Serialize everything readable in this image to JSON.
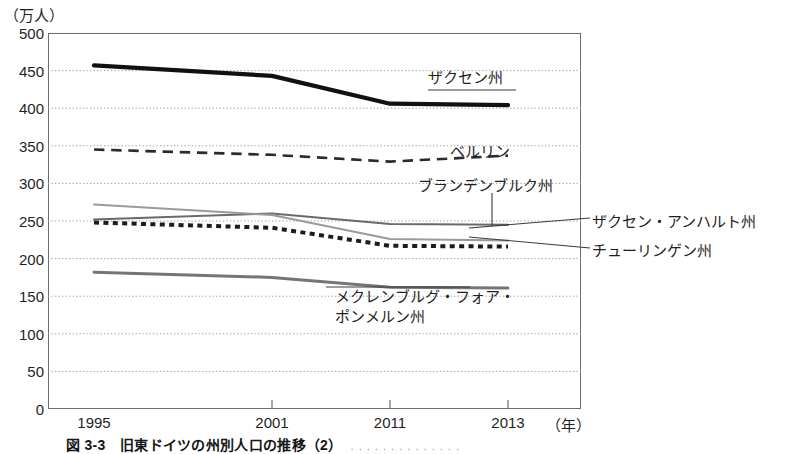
{
  "figure": {
    "caption": "図 3-3　旧東ドイツの州別人口の推移（2）",
    "caption_source": ". . . . . . . . . . . . . ."
  },
  "chart_data": {
    "type": "line",
    "title": "",
    "xlabel": "（年）",
    "ylabel": "（万人）",
    "x": [
      1995,
      2001,
      2011,
      2013
    ],
    "xlim": [
      1995,
      2013
    ],
    "ylim": [
      0,
      500
    ],
    "ytick_values": [
      0,
      50,
      100,
      150,
      200,
      250,
      300,
      350,
      400,
      450,
      500
    ],
    "ytick_labels": [
      "0",
      "50",
      "100",
      "150",
      "200",
      "250",
      "300",
      "350",
      "400",
      "450",
      "500"
    ],
    "xtick_values": [
      1995,
      2001,
      2011,
      2013
    ],
    "xtick_labels": [
      "1995",
      "2001",
      "2011",
      "2013"
    ],
    "grid": "horizontal-dotted",
    "legend": "inline-annotations",
    "series": [
      {
        "name": "ザクセン州",
        "values": [
          457,
          443,
          406,
          404
        ],
        "style": "solid-thick",
        "color": "#111111",
        "width": 4.2
      },
      {
        "name": "ベルリン",
        "values": [
          345,
          338,
          329,
          337
        ],
        "style": "dashed",
        "color": "#2b2b2b",
        "width": 2.6
      },
      {
        "name": "ブランデンブルク州",
        "values": [
          252,
          260,
          246,
          245
        ],
        "style": "solid-thin",
        "color": "#6a6a6a",
        "width": 2.0
      },
      {
        "name": "ザクセン・アンハルト州",
        "values": [
          272,
          258,
          226,
          224
        ],
        "style": "solid-thin",
        "color": "#9a9a9a",
        "width": 2.0
      },
      {
        "name": "チューリンゲン州",
        "values": [
          248,
          241,
          217,
          216
        ],
        "style": "dotted-thick",
        "color": "#1c1c1c",
        "width": 4.0
      },
      {
        "name": "メクレンブルグ・フォア・ポンメルン州",
        "values": [
          182,
          175,
          162,
          161
        ],
        "style": "solid-medium",
        "color": "#757575",
        "width": 3.0
      }
    ],
    "annotations": [
      {
        "text": "ザクセン州",
        "x": 428,
        "y": 77
      },
      {
        "text": "ベルリン",
        "x": 450,
        "y": 150
      },
      {
        "text": "ブランデンブルク州",
        "x": 418,
        "y": 185
      },
      {
        "text": "ザクセン・アンハルト州",
        "x": 592,
        "y": 222
      },
      {
        "text": "チューリンゲン州",
        "x": 592,
        "y": 251
      },
      {
        "text": "メクレンブルグ・フォア・",
        "text2": "ポンメルン州",
        "x": 335,
        "y": 293
      }
    ]
  }
}
